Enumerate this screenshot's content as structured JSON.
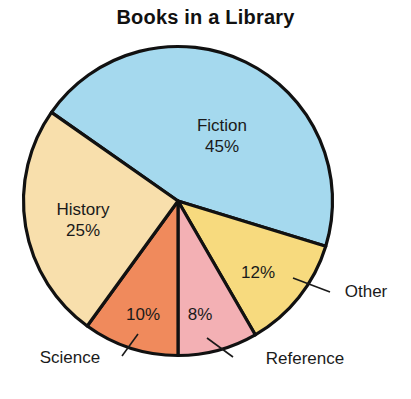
{
  "chart_data": {
    "type": "pie",
    "title": "Books in a Library",
    "xlabel": "",
    "ylabel": "",
    "legend_position": "none",
    "grid": false,
    "categories": [
      "Fiction",
      "Other",
      "Reference",
      "Science",
      "History"
    ],
    "values": [
      45,
      12,
      8,
      10,
      25
    ],
    "value_suffix": "%",
    "slices": [
      {
        "name": "Fiction",
        "value": 45,
        "value_label": "45%",
        "color": "#a5d9ee",
        "label_placement": "inside",
        "label_text": "Fiction",
        "start_angle_deg": -17,
        "end_angle_deg": 145
      },
      {
        "name": "Other",
        "value": 12,
        "value_label": "12%",
        "color": "#f7da7e",
        "label_placement": "callout",
        "label_text": "Other",
        "start_angle_deg": -60,
        "end_angle_deg": -17
      },
      {
        "name": "Reference",
        "value": 8,
        "value_label": "8%",
        "color": "#f3b0b4",
        "label_placement": "callout",
        "label_text": "Reference",
        "start_angle_deg": -90,
        "end_angle_deg": -60
      },
      {
        "name": "Science",
        "value": 10,
        "value_label": "10%",
        "color": "#f08a5c",
        "label_placement": "callout",
        "label_text": "Science",
        "start_angle_deg": -126,
        "end_angle_deg": -90
      },
      {
        "name": "History",
        "value": 25,
        "value_label": "25%",
        "color": "#f8dfac",
        "label_placement": "inside",
        "label_text": "History",
        "start_angle_deg": -215,
        "end_angle_deg": -126
      }
    ]
  },
  "labels": {
    "fiction_name": "Fiction",
    "fiction_value": "45%",
    "history_name": "History",
    "history_value": "25%",
    "science_name": "Science",
    "science_value": "10%",
    "reference_name": "Reference",
    "reference_value": "8%",
    "other_name": "Other",
    "other_value": "12%"
  },
  "colors": {
    "fiction": "#a5d9ee",
    "history": "#f8dfac",
    "science": "#f08a5c",
    "reference": "#f3b0b4",
    "other": "#f7da7e",
    "outline": "#111111",
    "text": "#1a1a1a",
    "background": "#ffffff"
  }
}
